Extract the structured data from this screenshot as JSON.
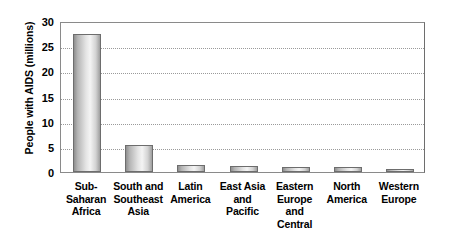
{
  "chart_data": {
    "type": "bar",
    "title": "",
    "xlabel": "",
    "ylabel": "People with AIDS (millions)",
    "ylim": [
      0,
      30
    ],
    "yticks": [
      0,
      5,
      10,
      15,
      20,
      25,
      30
    ],
    "ytick_labels": [
      "0",
      "5",
      "10",
      "15",
      "20",
      "25",
      "30"
    ],
    "grid": "horizontal-dotted",
    "legend": "none",
    "categories": [
      "Sub-Saharan Africa",
      "South and Southeast Asia",
      "Latin America",
      "East Asia and Pacific",
      "Eastern Europe and Central Asia",
      "North America",
      "Western Europe"
    ],
    "category_label_lines": [
      [
        "Sub-",
        "Saharan",
        "Africa"
      ],
      [
        "South and",
        "Southeast",
        "Asia"
      ],
      [
        "Latin",
        "America"
      ],
      [
        "East Asia",
        "and",
        "Pacific"
      ],
      [
        "Eastern",
        "Europe",
        "and",
        "Central Asia"
      ],
      [
        "North",
        "America"
      ],
      [
        "Western",
        "Europe"
      ]
    ],
    "values": [
      27.5,
      5.4,
      1.4,
      1.1,
      1.0,
      1.0,
      0.6
    ],
    "bar_color": "#d9d9d9",
    "bar_edge_color": "#6d6d6d",
    "grid_color": "#9a9a9a",
    "frame_color": "#8a8a8a",
    "background_color": "#ffffff"
  }
}
